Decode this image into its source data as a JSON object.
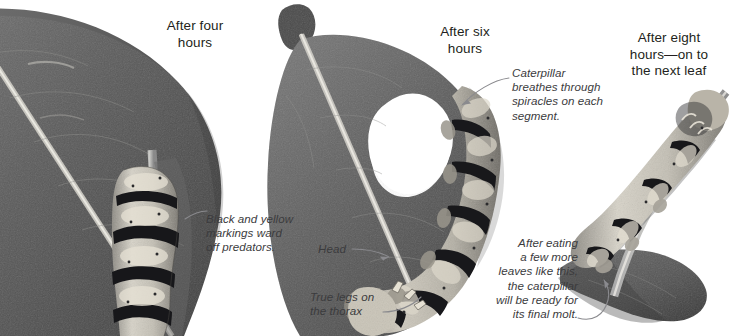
{
  "figure": {
    "kind": "photo-sequence-diagram",
    "background_color": "#ffffff",
    "heading_color": "#231f20",
    "caption_color": "#3b3b3d",
    "leader_line_color": "#8a8a8e"
  },
  "panels": [
    {
      "id": "panel-four-hours",
      "heading": "After four hours",
      "heading_lines": [
        "After four",
        "hours"
      ],
      "photo_alt": "Dark leaf with a caterpillar clinging to the leaf stem"
    },
    {
      "id": "panel-six-hours",
      "heading": "After six hours",
      "heading_lines": [
        "After six",
        "hours"
      ],
      "photo_alt": "Leaf with a large hole eaten out and a caterpillar curled along the edge"
    },
    {
      "id": "panel-eight-hours",
      "heading": "After eight hours—on to the next leaf",
      "heading_lines": [
        "After eight",
        "hours—on to",
        "the next leaf"
      ],
      "photo_alt": "Caterpillar crawling along a stem toward a fresh leaf"
    }
  ],
  "annotations": [
    {
      "id": "annotation-markings",
      "text": "Black and yellow markings ward off predators.",
      "lines": [
        "Black and yellow",
        "markings ward",
        "off predators."
      ],
      "align": "left",
      "pointer": "leader-line"
    },
    {
      "id": "annotation-spiracles",
      "text": "Caterpillar breathes through spiracles on each segment.",
      "lines": [
        "Caterpillar",
        "breathes through",
        "spiracles on each",
        "segment."
      ],
      "align": "left",
      "pointer": "leader-line-arrow"
    },
    {
      "id": "annotation-head",
      "text": "Head",
      "lines": [
        "Head"
      ],
      "align": "left",
      "pointer": "leader-line-arrow"
    },
    {
      "id": "annotation-true-legs",
      "text": "True legs on the thorax",
      "lines": [
        "True legs on",
        "the thorax"
      ],
      "align": "left",
      "pointer": "leader-line"
    },
    {
      "id": "annotation-final-molt",
      "text": "After eating a few more leaves like this, the caterpillar will be ready for its final molt.",
      "lines": [
        "After eating",
        "a few more",
        "leaves like this,",
        "the caterpillar",
        "will be ready for",
        "its final molt."
      ],
      "align": "right",
      "pointer": "leader-line-arrow"
    }
  ]
}
